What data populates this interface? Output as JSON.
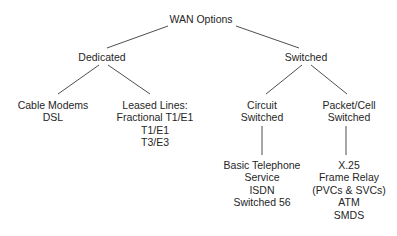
{
  "diagram": {
    "title_fragment": "clipped-heading",
    "root": {
      "label": "WAN Options",
      "cx": 201,
      "top": 13
    },
    "level2": [
      {
        "id": "dedicated",
        "label": "Dedicated",
        "cx": 102,
        "top": 51
      },
      {
        "id": "switched",
        "label": "Switched",
        "cx": 306,
        "top": 51
      }
    ],
    "level3": [
      {
        "id": "cable-modems",
        "cx": 53,
        "top": 99,
        "lines": [
          "Cable Modems",
          "DSL"
        ]
      },
      {
        "id": "leased-lines",
        "cx": 155,
        "top": 99,
        "lines": [
          "Leased Lines:",
          "Fractional T1/E1",
          "T1/E1",
          "T3/E3"
        ]
      },
      {
        "id": "circuit-switched",
        "cx": 262,
        "top": 99,
        "lines": [
          "Circuit",
          "Switched"
        ]
      },
      {
        "id": "packet-cell-switched",
        "cx": 349,
        "top": 99,
        "lines": [
          "Packet/Cell",
          "Switched"
        ]
      }
    ],
    "level4": [
      {
        "id": "circuit-switched-services",
        "cx": 262,
        "top": 159,
        "lines": [
          "Basic Telephone",
          "Service",
          "ISDN",
          "Switched 56"
        ]
      },
      {
        "id": "packet-cell-services",
        "cx": 349,
        "top": 159,
        "lines": [
          "X.25",
          "Frame Relay",
          "(PVCs & SVCs)",
          "ATM",
          "SMDS"
        ]
      }
    ],
    "edges": [
      {
        "id": "root-to-dedicated",
        "x1": 168,
        "y1": 26,
        "x2": 107,
        "y2": 48
      },
      {
        "id": "root-to-switched",
        "x1": 236,
        "y1": 26,
        "x2": 299,
        "y2": 48
      },
      {
        "id": "dedicated-to-cable-modems",
        "x1": 99,
        "y1": 65,
        "x2": 58,
        "y2": 94
      },
      {
        "id": "dedicated-to-leased-lines",
        "x1": 108,
        "y1": 65,
        "x2": 150,
        "y2": 94
      },
      {
        "id": "switched-to-circuit",
        "x1": 302,
        "y1": 65,
        "x2": 266,
        "y2": 94
      },
      {
        "id": "switched-to-packet-cell",
        "x1": 311,
        "y1": 65,
        "x2": 347,
        "y2": 94
      },
      {
        "id": "circuit-to-services",
        "x1": 262,
        "y1": 126,
        "x2": 262,
        "y2": 155
      },
      {
        "id": "packet-cell-to-services",
        "x1": 346,
        "y1": 126,
        "x2": 346,
        "y2": 155
      }
    ],
    "colors": {
      "background": "#ffffff",
      "text": "#262626",
      "line": "#3a3a3a"
    }
  }
}
